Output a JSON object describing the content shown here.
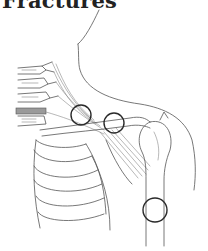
{
  "title": "Fractures",
  "illustration": {
    "subject": "shoulder-anatomy-line-drawing",
    "colors": {
      "line": "#555555",
      "marker": "#2a2a2a",
      "background": "#ffffff"
    },
    "fracture_markers": [
      {
        "id": "medial-clavicle",
        "cx": 81,
        "cy": 115,
        "r": 10
      },
      {
        "id": "mid-clavicle",
        "cx": 114,
        "cy": 123,
        "r": 10
      },
      {
        "id": "humeral-shaft",
        "cx": 155,
        "cy": 210,
        "r": 12
      }
    ]
  }
}
